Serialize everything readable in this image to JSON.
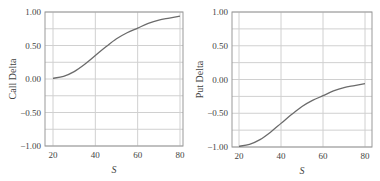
{
  "chart_data": [
    {
      "type": "line",
      "title": "",
      "xlabel": "S",
      "ylabel": "Call Delta",
      "xlim": [
        20,
        80
      ],
      "ylim": [
        -1.0,
        1.0
      ],
      "x_ticks": [
        "20",
        "40",
        "60",
        "80"
      ],
      "y_ticks": [
        "1.00",
        "0.50",
        "0.00",
        "-0.50",
        "-1.00"
      ],
      "grid": true,
      "series": [
        {
          "name": "Call Delta",
          "x": [
            20,
            25,
            30,
            35,
            40,
            45,
            50,
            55,
            60,
            65,
            70,
            75,
            80
          ],
          "values": [
            0.01,
            0.04,
            0.11,
            0.22,
            0.35,
            0.48,
            0.6,
            0.69,
            0.76,
            0.83,
            0.88,
            0.91,
            0.94
          ]
        }
      ]
    },
    {
      "type": "line",
      "title": "",
      "xlabel": "S",
      "ylabel": "Put Delta",
      "xlim": [
        20,
        80
      ],
      "ylim": [
        -1.0,
        1.0
      ],
      "x_ticks": [
        "20",
        "40",
        "60",
        "80"
      ],
      "y_ticks": [
        "1.00",
        "0.50",
        "0.00",
        "-0.50",
        "-1.00"
      ],
      "grid": true,
      "series": [
        {
          "name": "Put Delta",
          "x": [
            20,
            25,
            30,
            35,
            40,
            45,
            50,
            55,
            60,
            65,
            70,
            75,
            80
          ],
          "values": [
            -0.99,
            -0.96,
            -0.89,
            -0.78,
            -0.65,
            -0.52,
            -0.4,
            -0.31,
            -0.24,
            -0.17,
            -0.12,
            -0.09,
            -0.06
          ]
        }
      ]
    }
  ],
  "colors": {
    "line": "#6b6b6b",
    "grid": "#d0d0d0",
    "axis": "#999999",
    "text": "#444444"
  }
}
